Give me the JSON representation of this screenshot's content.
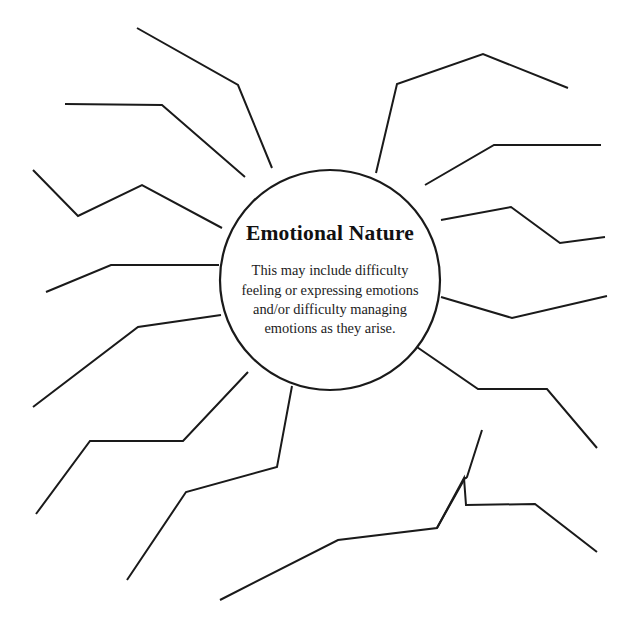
{
  "page": {
    "background_color": "#ffffff",
    "line_color": "#1a1a1a",
    "width": 637,
    "height": 644
  },
  "center": {
    "title": "Emotional Nature",
    "description": "This may include difficulty feeling or expressing emotions and/or difficulty managing emotions as they arise.",
    "circle": {
      "cx": 330,
      "cy": 280,
      "r": 110,
      "fill": "#ffffff",
      "stroke": "#1a1a1a"
    }
  },
  "spokes": [
    {
      "id": "spoke-n-nw",
      "label": "blank branch upper-left-top",
      "points": "137,28 238,85 272,168"
    },
    {
      "id": "spoke-nw-upper",
      "label": "blank branch upper-left horizontal",
      "points": "65,104 162,105 245,177"
    },
    {
      "id": "spoke-nw-zigzag",
      "label": "blank branch upper-left zigzag",
      "points": "33,170 78,216 142,185 222,228"
    },
    {
      "id": "spoke-w",
      "label": "blank branch left horizontal",
      "points": "46,292 111,265 219,265"
    },
    {
      "id": "spoke-sw-upper",
      "label": "blank branch lower-left upper",
      "points": "33,407 138,327 221,315"
    },
    {
      "id": "spoke-sw-middle",
      "label": "blank branch lower-left middle",
      "points": "36,514 90,441 183,441 248,372"
    },
    {
      "id": "spoke-sw-lower",
      "label": "blank branch lower-left lower",
      "points": "127,580 186,492 277,467 292,386"
    },
    {
      "id": "spoke-s",
      "label": "blank branch bottom",
      "points": "220,600 338,540 437,528 465,478 466,478 467,477 482,430"
    },
    {
      "id": "spoke-se-lower",
      "label": "blank branch lower-right lower",
      "points": "597,552 535,504 466,505 464,478 437,528"
    },
    {
      "id": "spoke-se-mid",
      "label": "blank branch lower-right middle",
      "points": "414,345 478,389 547,389 597,448"
    },
    {
      "id": "spoke-e-lower",
      "label": "blank branch right lower",
      "points": "441,297 512,318 607,296"
    },
    {
      "id": "spoke-e-upper",
      "label": "blank branch right upper",
      "points": "441,220 511,207 560,243 605,237"
    },
    {
      "id": "spoke-ne-lower",
      "label": "blank branch upper-right lower",
      "points": "425,185 494,145 601,145"
    },
    {
      "id": "spoke-ne-upper",
      "label": "blank branch upper-right upper",
      "points": "376,173 397,84 483,54 568,88"
    }
  ],
  "spoke_count": 14
}
